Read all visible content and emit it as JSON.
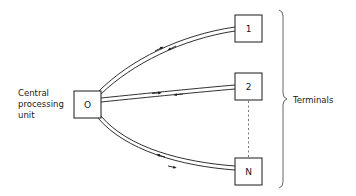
{
  "diagram": {
    "type": "star network",
    "central_unit": {
      "label_lines": [
        "Central",
        "processing",
        "unit"
      ],
      "box_label": "O"
    },
    "terminals": [
      {
        "id": "terminal-1",
        "label": "1"
      },
      {
        "id": "terminal-2",
        "label": "2"
      },
      {
        "id": "terminal-n",
        "label": "N"
      }
    ],
    "group_label": "Terminals",
    "connections": [
      {
        "from": "O",
        "to": "1",
        "bidirectional": true
      },
      {
        "from": "O",
        "to": "2",
        "bidirectional": true
      },
      {
        "from": "O",
        "to": "N",
        "bidirectional": true
      }
    ],
    "ellipsis_between": [
      "2",
      "N"
    ],
    "colors": {
      "stroke": "#1a1a1a",
      "background": "#ffffff",
      "brace": "#555555"
    }
  }
}
